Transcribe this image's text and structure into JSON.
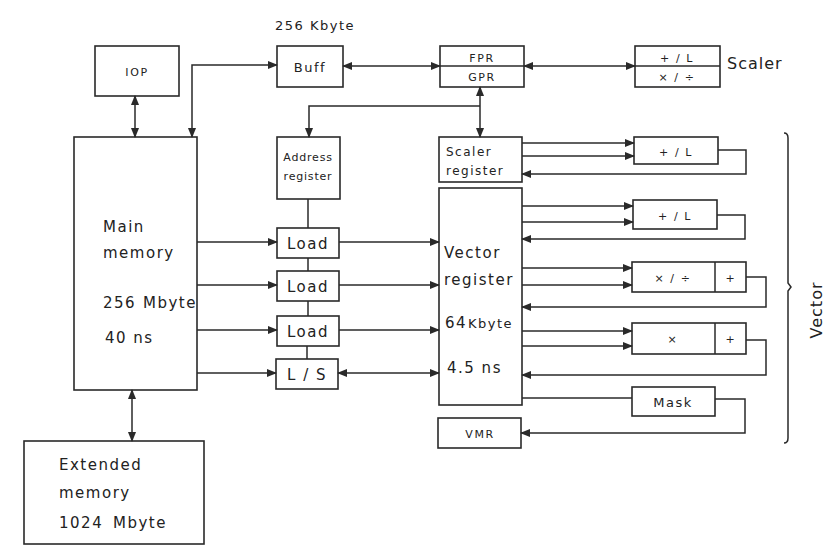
{
  "diagram": {
    "buffer_caption": "256 Kbyte",
    "scaler_caption": "Scaler",
    "vector_caption": "Vector",
    "iop": {
      "label": "IOP"
    },
    "buff": {
      "label": "Buff"
    },
    "fpr_gpr": {
      "top": "FPR",
      "bottom": "GPR"
    },
    "scaler_unit": {
      "top": "+ / L",
      "bottom": "× / ÷"
    },
    "main_memory": {
      "line1": "Main",
      "line2": "memory",
      "size_num": "256",
      "size_unit": "Mbyte",
      "speed": "40 ns"
    },
    "extended_memory": {
      "line1": "Extended",
      "line2": "memory",
      "size_num": "1024",
      "size_unit": "Mbyte"
    },
    "address_register": {
      "line1": "Address",
      "line2": "register"
    },
    "load_store_pipes": [
      {
        "label": "Load"
      },
      {
        "label": "Load"
      },
      {
        "label": "Load"
      },
      {
        "label": "L / S"
      }
    ],
    "scaler_register": {
      "line1": "Scaler",
      "line2": "register"
    },
    "vector_register": {
      "line1": "Vector",
      "line2": "register",
      "size_num": "64",
      "size_unit": "Kbyte",
      "speed": "4.5 ns"
    },
    "vmr": {
      "label": "VMR"
    },
    "vector_pipes": [
      {
        "label": "+ / L",
        "extra": ""
      },
      {
        "label": "+ / L",
        "extra": ""
      },
      {
        "label": "× / ÷",
        "extra": "+"
      },
      {
        "label": "×",
        "extra": "+"
      }
    ],
    "mask": {
      "label": "Mask"
    }
  }
}
